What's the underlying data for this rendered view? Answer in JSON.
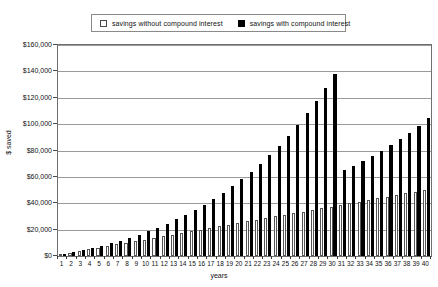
{
  "legend": {
    "entries": [
      {
        "label": "savings without compound interest",
        "swatch": "open-square-icon",
        "color": "#ffffff"
      },
      {
        "label": "savings with compound interest",
        "swatch": "filled-square-icon",
        "color": "#000000"
      }
    ]
  },
  "axes": {
    "y_title": "$ saved",
    "x_title": "years",
    "y_ticks": [
      "$0",
      "$20,000",
      "$40,000",
      "$60,000",
      "$80,000",
      "$100,000",
      "$120,000",
      "$140,000",
      "$160,000"
    ]
  },
  "chart_data": {
    "type": "bar",
    "title": "",
    "subtitle": "",
    "xlabel": "years",
    "ylabel": "$ saved",
    "ylim": [
      0,
      160000
    ],
    "ytick_values": [
      0,
      20000,
      40000,
      60000,
      80000,
      100000,
      120000,
      140000,
      160000
    ],
    "grid": true,
    "legend_position": "top",
    "categories": [
      1,
      2,
      3,
      4,
      5,
      6,
      7,
      8,
      9,
      10,
      11,
      12,
      13,
      14,
      15,
      16,
      17,
      18,
      19,
      20,
      21,
      22,
      23,
      24,
      25,
      26,
      27,
      28,
      29,
      30,
      31,
      32,
      33,
      34,
      35,
      36,
      37,
      38,
      39,
      40
    ],
    "series": [
      {
        "name": "savings without compound interest",
        "color": "#ffffff",
        "values": [
          1250,
          2500,
          3750,
          5000,
          6250,
          7500,
          8750,
          10000,
          11250,
          12500,
          13750,
          15000,
          16250,
          17500,
          18750,
          20000,
          21250,
          22500,
          23750,
          25000,
          26250,
          27500,
          28750,
          30000,
          31250,
          32500,
          33750,
          35000,
          36250,
          37500,
          38750,
          40000,
          41250,
          42500,
          43750,
          45000,
          46250,
          47500,
          48750,
          50000
        ]
      },
      {
        "name": "savings with compound interest",
        "color": "#000000",
        "values": [
          1300,
          2700,
          4200,
          5800,
          7600,
          9500,
          11600,
          13800,
          16200,
          18800,
          21600,
          24600,
          27800,
          31300,
          35000,
          39000,
          43300,
          47900,
          52900,
          58200,
          63900,
          70000,
          76600,
          83700,
          91300,
          99400,
          108100,
          117500,
          127500,
          138300,
          64900,
          68300,
          71900,
          75700,
          79800,
          84100,
          88700,
          93600,
          98800,
          104300
        ]
      }
    ]
  }
}
